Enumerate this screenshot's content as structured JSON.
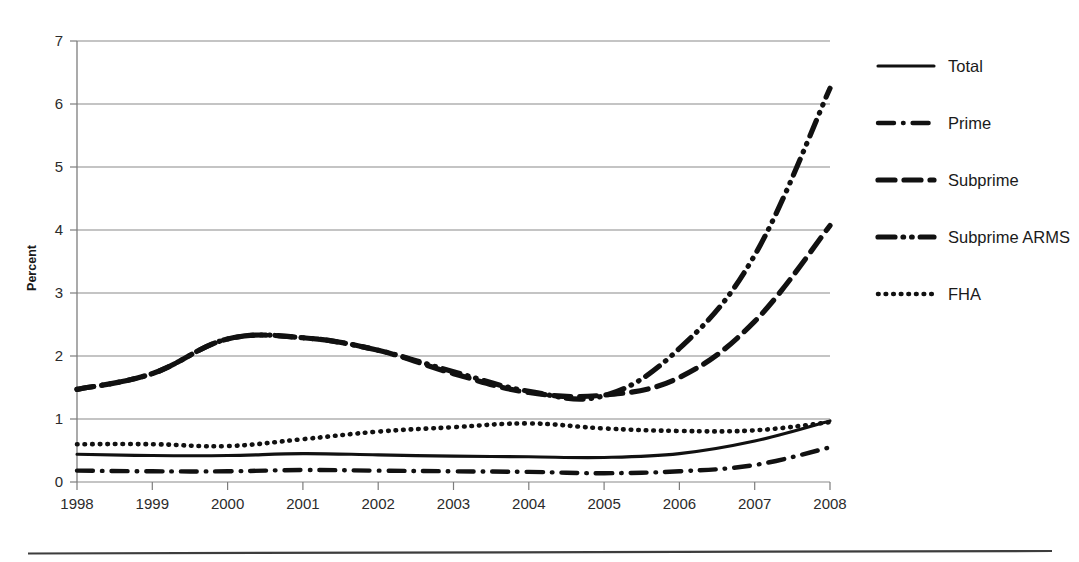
{
  "chart_data": {
    "type": "line",
    "title": "",
    "subtitle": "",
    "xlabel": "",
    "ylabel": "Percent",
    "categories": [
      "1998",
      "1999",
      "2000",
      "2001",
      "2002",
      "2003",
      "2004",
      "2005",
      "2006",
      "2007",
      "2008"
    ],
    "x": [
      1998,
      1999,
      2000,
      2001,
      2002,
      2003,
      2004,
      2005,
      2006,
      2007,
      2008
    ],
    "xlim": [
      1998,
      2008
    ],
    "ylim": [
      0,
      7
    ],
    "yticks": [
      0,
      1,
      2,
      3,
      4,
      5,
      6,
      7
    ],
    "ytick_labels": [
      "0",
      "1",
      "2",
      "3",
      "4",
      "5",
      "6",
      "7"
    ],
    "grid": "horizontal",
    "legend_position": "right",
    "series": [
      {
        "name": "Total",
        "style": "solid",
        "color": "#111111",
        "values": [
          0.44,
          0.42,
          0.42,
          0.45,
          0.43,
          0.41,
          0.4,
          0.39,
          0.45,
          0.65,
          0.97
        ]
      },
      {
        "name": "Prime",
        "style": "dash-dot",
        "color": "#111111",
        "values": [
          0.18,
          0.17,
          0.17,
          0.19,
          0.18,
          0.17,
          0.16,
          0.14,
          0.17,
          0.27,
          0.55
        ]
      },
      {
        "name": "Subprime",
        "style": "dashed",
        "color": "#111111",
        "values": [
          1.47,
          1.72,
          2.27,
          2.29,
          2.09,
          1.72,
          1.42,
          1.38,
          1.66,
          2.55,
          4.07
        ]
      },
      {
        "name": "Subprime ARMS",
        "style": "dash-dot-dot",
        "color": "#111111",
        "values": [
          1.47,
          1.72,
          2.27,
          2.29,
          2.09,
          1.75,
          1.44,
          1.37,
          2.12,
          3.6,
          6.25
        ]
      },
      {
        "name": "FHA",
        "style": "dotted",
        "color": "#111111",
        "values": [
          0.6,
          0.6,
          0.57,
          0.68,
          0.8,
          0.87,
          0.93,
          0.85,
          0.81,
          0.82,
          0.95
        ]
      }
    ]
  },
  "legend": {
    "items": [
      {
        "label": "Total",
        "style": "solid"
      },
      {
        "label": "Prime",
        "style": "dash-dot"
      },
      {
        "label": "Subprime",
        "style": "dashed"
      },
      {
        "label": "Subprime ARMS",
        "style": "dash-dot-dot"
      },
      {
        "label": "FHA",
        "style": "dotted"
      }
    ]
  },
  "axes": {
    "y_title": "Percent",
    "y_labels": [
      "7",
      "6",
      "5",
      "4",
      "3",
      "2",
      "1",
      "0"
    ],
    "x_labels": [
      "1998",
      "1999",
      "2000",
      "2001",
      "2002",
      "2003",
      "2004",
      "2005",
      "2006",
      "2007",
      "2008"
    ]
  }
}
